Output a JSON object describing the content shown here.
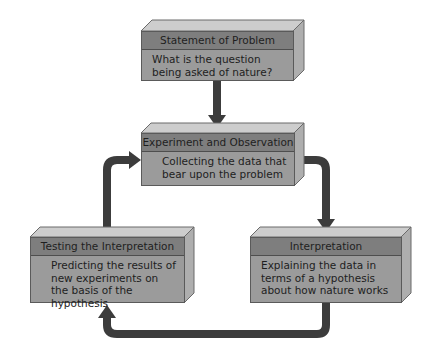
{
  "diagram": {
    "colors": {
      "header": "#7e7e7e",
      "body": "#9b9b9b",
      "top_face": "#cdcdcd",
      "side_face": "#aeaeae",
      "arrow": "#3c3c3c"
    },
    "boxes": [
      {
        "id": "statement",
        "title": "Statement of Problem",
        "text": "What is the question being asked of nature?"
      },
      {
        "id": "experiment",
        "title": "Experiment and Observation",
        "text": "Collecting the data that bear upon the problem"
      },
      {
        "id": "testing",
        "title": "Testing the Interpretation",
        "text": "Predicting the results of new experiments on the basis of the hypothesis"
      },
      {
        "id": "interpretation",
        "title": "Interpretation",
        "text": "Explaining the data in terms of a hypothesis about how nature works"
      }
    ],
    "arrows": [
      {
        "from": "Statement of Problem",
        "to": "Experiment and Observation"
      },
      {
        "from": "Experiment and Observation",
        "to": "Interpretation"
      },
      {
        "from": "Interpretation",
        "to": "Testing the Interpretation"
      },
      {
        "from": "Testing the Interpretation",
        "to": "Experiment and Observation"
      }
    ]
  }
}
